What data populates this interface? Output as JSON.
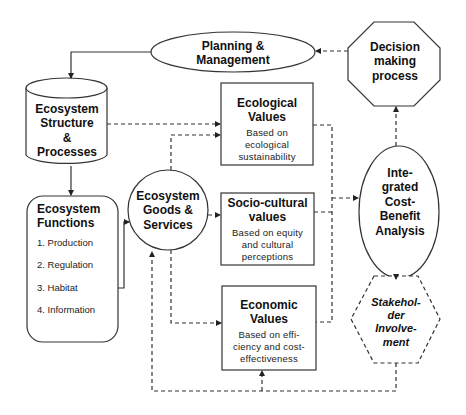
{
  "diagram": {
    "nodes": {
      "planning": {
        "title": "Planning & Management",
        "shape": "ellipse"
      },
      "decision": {
        "title": "Decision making process",
        "shape": "octagon"
      },
      "structure": {
        "title": "Ecosystem Structure & Processes",
        "shape": "cylinder"
      },
      "functions": {
        "title": "Ecosystem Functions",
        "shape": "rounded-rectangle",
        "items": [
          "1. Production",
          "2. Regulation",
          "3. Habitat",
          "4. Information"
        ]
      },
      "goods": {
        "title": "Ecosystem Goods & Services",
        "shape": "circle"
      },
      "ecological": {
        "title": "Ecological Values",
        "subtitle": "Based on ecological sustainability",
        "shape": "rectangle"
      },
      "socio": {
        "title": "Socio-cultural values",
        "subtitle": "Based on equity and cultural perceptions",
        "shape": "rectangle"
      },
      "economic": {
        "title": "Economic Values",
        "subtitle": "Based on efficiency and cost-effectiveness",
        "shape": "rectangle"
      },
      "integrated": {
        "title": "Integrated Cost-Benefit Analysis",
        "shape": "ellipse"
      },
      "stakeholder": {
        "title": "Stakeholder Involvement",
        "shape": "dashed-hexagon"
      }
    },
    "labels": {
      "planning": [
        "Planning &",
        "Management"
      ],
      "decision": [
        "Decision",
        "making",
        "process"
      ],
      "structure": [
        "Ecosystem",
        "Structure",
        "&",
        "Processes"
      ],
      "functions_title": [
        "Ecosystem",
        "Functions"
      ],
      "goods": [
        "Ecosystem",
        "Goods &",
        "Services"
      ],
      "ecological_title": [
        "Ecological",
        "Values"
      ],
      "ecological_sub": [
        "Based on",
        "ecological",
        "sustainability"
      ],
      "socio_title": [
        "Socio-cultural",
        "values"
      ],
      "socio_sub": [
        "Based on equity",
        "and cultural",
        "perceptions"
      ],
      "economic_title": [
        "Economic",
        "Values"
      ],
      "economic_sub": [
        "Based on effi-",
        "ciency and cost-",
        "effectiveness"
      ],
      "integrated": [
        "Inte-",
        "grated",
        "Cost-",
        "Benefit",
        "Analysis"
      ],
      "stakeholder": [
        "Stakehol-",
        "der",
        "Involve-",
        "ment"
      ]
    },
    "edges": [
      {
        "from": "planning",
        "to": "structure",
        "style": "solid"
      },
      {
        "from": "structure",
        "to": "functions",
        "style": "solid"
      },
      {
        "from": "functions",
        "to": "goods",
        "style": "solid"
      },
      {
        "from": "structure",
        "to": "ecological",
        "style": "dashed"
      },
      {
        "from": "goods",
        "to": "ecological",
        "style": "dashed"
      },
      {
        "from": "goods",
        "to": "socio",
        "style": "dashed"
      },
      {
        "from": "goods",
        "to": "economic",
        "style": "dashed"
      },
      {
        "from": "ecological",
        "to": "integrated",
        "style": "dashed"
      },
      {
        "from": "socio",
        "to": "integrated",
        "style": "dashed"
      },
      {
        "from": "economic",
        "to": "integrated",
        "style": "dashed"
      },
      {
        "from": "integrated",
        "to": "decision",
        "style": "dashed"
      },
      {
        "from": "decision",
        "to": "planning",
        "style": "dashed"
      },
      {
        "from": "stakeholder",
        "to": "integrated",
        "style": "dashed"
      },
      {
        "from": "stakeholder",
        "to": "economic",
        "style": "dashed"
      },
      {
        "from": "stakeholder",
        "to": "goods",
        "style": "dashed"
      }
    ],
    "colors": {
      "stroke": "#333333",
      "background": "#ffffff",
      "text": "#111111"
    }
  }
}
